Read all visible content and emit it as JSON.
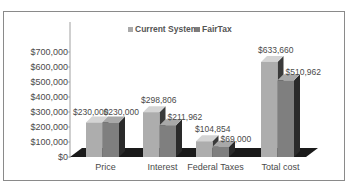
{
  "chart_data": {
    "type": "bar",
    "style": "3d-clustered-column",
    "title": "",
    "xlabel": "",
    "ylabel": "",
    "categories": [
      "Price",
      "Interest",
      "Federal Taxes",
      "Total cost"
    ],
    "series": [
      {
        "name": "Current System",
        "values": [
          230000,
          298806,
          104854,
          633660
        ],
        "labels": [
          "$230,000",
          "$298,806",
          "$104,854",
          "$633,660"
        ],
        "color": "#a9a9a9"
      },
      {
        "name": "FairTax",
        "values": [
          230000,
          211962,
          69000,
          510962
        ],
        "labels": [
          "$230,000",
          "$211,962",
          "$69,000",
          "$510,962"
        ],
        "color": "#7d7d7d"
      }
    ],
    "ylim": [
      0,
      700000
    ],
    "yticks": [
      0,
      100000,
      200000,
      300000,
      400000,
      500000,
      600000,
      700000
    ],
    "ytick_labels": [
      "$0",
      "$100,000",
      "$200,000",
      "$300,000",
      "$400,000",
      "$500,000",
      "$600,000",
      "$700,000"
    ],
    "legend": {
      "position": "top",
      "entries": [
        "Current System",
        "FairTax"
      ]
    },
    "grid": false
  }
}
